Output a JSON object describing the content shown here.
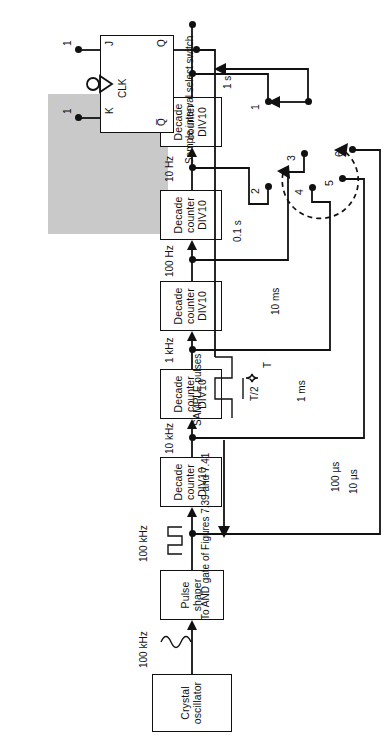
{
  "figure": {
    "type": "block-diagram"
  },
  "blocks": [
    {
      "id": "crystal-oscillator",
      "lines": [
        "Crystal",
        "oscillator"
      ]
    },
    {
      "id": "pulse-shaper",
      "lines": [
        "Pulse",
        "shaper"
      ]
    },
    {
      "id": "decade-counter-1",
      "lines": [
        "Decade",
        "counter",
        "DIV10"
      ]
    },
    {
      "id": "decade-counter-2",
      "lines": [
        "Decade",
        "counter",
        "DIV10"
      ]
    },
    {
      "id": "decade-counter-3",
      "lines": [
        "Decade",
        "counter",
        "DIV10"
      ]
    },
    {
      "id": "decade-counter-4",
      "lines": [
        "Decade",
        "counter",
        "DIV10"
      ]
    },
    {
      "id": "decade-counter-5",
      "lines": [
        "Decade",
        "counter",
        "DIV10"
      ]
    }
  ],
  "chain_labels": {
    "osc_out": "100 kHz",
    "shaper_out": "100 kHz",
    "tap_10khz": "10 kHz",
    "tap_1khz": "1 kHz",
    "tap_100hz": "100 Hz",
    "tap_10hz": "10 Hz",
    "tap_1hz": "1 Hz"
  },
  "waveform_symbols": {
    "oscillator": "sine-wave",
    "shaper": "square-wave"
  },
  "switch": {
    "name": "Sample interval select switch",
    "caption_lines": [
      "Sample interval",
      "select switch"
    ],
    "positions": [
      {
        "number": "1",
        "interval": "1 s"
      },
      {
        "number": "2",
        "interval": "0.1 s"
      },
      {
        "number": "3",
        "interval": "10 ms"
      },
      {
        "number": "4",
        "interval": "1 ms"
      },
      {
        "number": "5",
        "interval": "100 µs"
      },
      {
        "number": "6",
        "interval": "10 µs"
      }
    ],
    "selected": "1",
    "rotation_indicator": "dashed-curved-double-arrow"
  },
  "flipflop": {
    "name": "JK flip-flop",
    "inputs": [
      {
        "pin": "J",
        "value": "1"
      },
      {
        "pin": "K",
        "value": "1"
      }
    ],
    "clock": {
      "pin": "CLK",
      "edge": "negative-edge-triggered"
    },
    "outputs": [
      {
        "pin": "Q"
      },
      {
        "pin": "Q̅"
      }
    ]
  },
  "sample_output": {
    "waveform_label_lines": [
      "SAMPLE",
      "pulses"
    ],
    "half_period": "T/2",
    "period": "T",
    "destination_lines": [
      "To",
      "AND gate",
      "of Figures 7.39",
      "and 7.41"
    ]
  },
  "colors": {
    "ink": "#111111",
    "shade": "#c9c9c9",
    "paper": "#ffffff"
  }
}
